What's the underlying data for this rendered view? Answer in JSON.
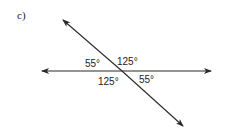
{
  "part_label": "c)",
  "angles": {
    "top_left": "55°",
    "top_right": "125°",
    "bottom_left": "125°",
    "bottom_right": "55°"
  },
  "colors": {
    "line": "#2a2a2a",
    "text": "#222222"
  }
}
